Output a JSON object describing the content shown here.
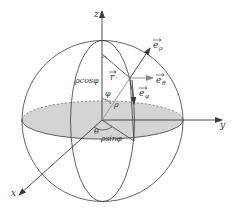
{
  "diagram": {
    "title": "",
    "colors": {
      "line": "#3a3a3a",
      "equator_fill": "#d4d4d4",
      "ray": "#9a9a9a",
      "background": "#ffffff"
    },
    "axes": {
      "x_label": "x",
      "y_label": "y",
      "z_label": "z"
    },
    "labels": {
      "e_rho": "e",
      "e_rho_sub": "ρ",
      "e_theta": "e",
      "e_theta_sub": "θ",
      "e_phi": "e",
      "e_phi_sub": "φ",
      "r_vec": "r",
      "rho_cos_phi": "ρcosφ",
      "phi": "φ",
      "rho": "ρ",
      "theta": "θ",
      "rho_sin_phi": "ρsinφ"
    }
  }
}
